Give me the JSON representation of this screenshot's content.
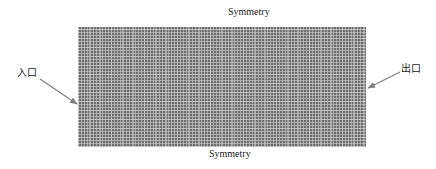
{
  "diagram": {
    "type": "computational-mesh",
    "labels": {
      "top_boundary": "Symmetry",
      "bottom_boundary": "Symmetry",
      "inlet": "入口",
      "outlet": "出口"
    },
    "colors": {
      "mesh_fill": "#6e6e6e",
      "mesh_lines": "#d7d7d7",
      "arrow": "#808080",
      "text": "#1a1a1a"
    }
  }
}
